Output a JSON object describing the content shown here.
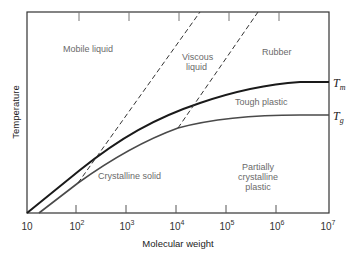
{
  "figure": {
    "title": "",
    "x_axis": {
      "label": "Molecular weight",
      "scale": "log",
      "ticks": [
        {
          "base": "10",
          "exp": ""
        },
        {
          "base": "10",
          "exp": "2"
        },
        {
          "base": "10",
          "exp": "3"
        },
        {
          "base": "10",
          "exp": "4"
        },
        {
          "base": "10",
          "exp": "5"
        },
        {
          "base": "10",
          "exp": "6"
        },
        {
          "base": "10",
          "exp": "7"
        }
      ]
    },
    "y_axis": {
      "label": "Temperature"
    },
    "curves": {
      "tm": {
        "symbol": "T",
        "subscript": "m",
        "style": "solid-thick",
        "color": "#1a1a1a"
      },
      "tg": {
        "symbol": "T",
        "subscript": "g",
        "style": "solid",
        "color": "#4a4a4a"
      },
      "boundaries": {
        "style": "dashed",
        "color": "#333333"
      }
    },
    "regions": {
      "mobile_liquid": "Mobile liquid",
      "viscous_liquid_1": "Viscous",
      "viscous_liquid_2": "liquid",
      "rubber": "Rubber",
      "tough_plastic": "Tough plastic",
      "crystalline_solid": "Crystalline solid",
      "partially_crystalline_1": "Partially",
      "partially_crystalline_2": "crystalline",
      "partially_crystalline_3": "plastic"
    }
  }
}
